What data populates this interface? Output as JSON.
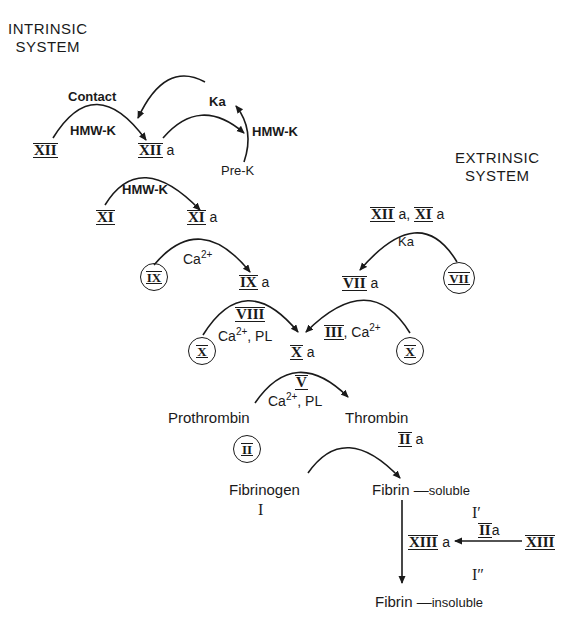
{
  "headers": {
    "intrinsic": [
      "INTRINSIC",
      "SYSTEM"
    ],
    "extrinsic": [
      "EXTRINSIC",
      "SYSTEM"
    ]
  },
  "intrinsic": {
    "contact_label": "Contact",
    "hmwk_1": "HMW-K",
    "factor_xii": "XII",
    "factor_xiia": "XII",
    "suffix_a": "a",
    "ka": "Ka",
    "hmwk_2": "HMW-K",
    "pre_k": "Pre-K",
    "hmwk_3": "HMW-K",
    "factor_xi": "XI",
    "factor_xia": "XI",
    "ca_label": "Ca",
    "ca_charge": "2+",
    "factor_ix": "IX",
    "factor_ixa": "IX"
  },
  "extrinsic": {
    "cofactors_top": "XII a, XI a",
    "cofactor_xii": "XII",
    "cofactor_xi": "XI",
    "ka": "Ka",
    "factor_vii": "VII",
    "factor_viia": "VII",
    "factor_iii": "III",
    "ca_charge": "2+"
  },
  "common": {
    "factor_viii": "VIII",
    "ca_pl_left": "Ca",
    "pl": ", PL",
    "factor_x_left": "X",
    "factor_x_right": "X",
    "factor_xa": "X",
    "factor_v": "V",
    "prothrombin": "Prothrombin",
    "factor_ii": "II",
    "thrombin": "Thrombin",
    "factor_iia": "II",
    "fibrinogen": "Fibrinogen",
    "factor_i": "I",
    "fibrin": "Fibrin",
    "soluble": "soluble",
    "i_prime": "I′",
    "factor_xiiia": "XIII",
    "iia_label": "II",
    "factor_xiii": "XIII",
    "i_double_prime": "I″",
    "fibrin_2": "Fibrin",
    "insoluble": "insoluble"
  },
  "colors": {
    "ink": "#1a1a1a",
    "background": "#ffffff"
  }
}
